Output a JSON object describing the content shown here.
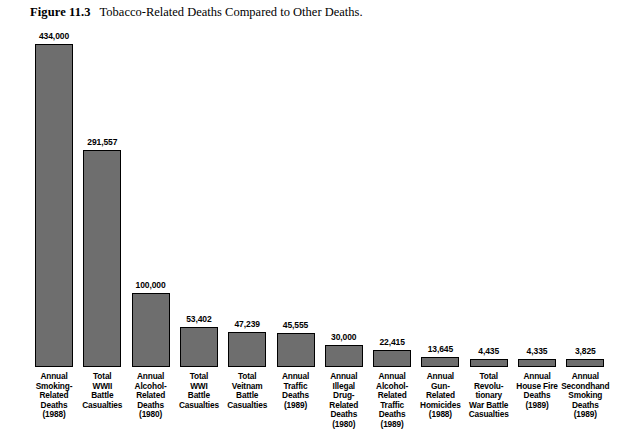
{
  "figure": {
    "label": "Figure 11.3",
    "title": "Tobacco-Related Deaths Compared to Other Deaths."
  },
  "chart_data": {
    "type": "bar",
    "title": "Tobacco-Related Deaths Compared to Other Deaths.",
    "xlabel": "",
    "ylabel": "",
    "ylim": [
      0,
      434000
    ],
    "grid": false,
    "legend": "none",
    "bar_color": "#6e6e6e",
    "bar_border_color": "#000000",
    "categories": [
      "Annual Smoking-Related Deaths (1988)",
      "Total WWII Battle Casualties",
      "Annual Alcohol-Related Deaths (1980)",
      "Total WWI Battle Casualties",
      "Total Veitnam Battle Casualties",
      "Annual Traffic Deaths (1989)",
      "Annual Illegal Drug-Related Deaths (1980)",
      "Annual Alcohol-Related Traffic Deaths (1989)",
      "Annual Gun-Related Homicides (1988)",
      "Total Revolutionary War Battle Casualties",
      "Annual House Fire Deaths (1989)",
      "Annual Secondhand Smoking Deaths (1989)"
    ],
    "values": [
      434000,
      291557,
      100000,
      53402,
      47239,
      45555,
      30000,
      22415,
      13645,
      4435,
      4335,
      3825
    ],
    "value_labels": [
      "434,000",
      "291,557",
      "100,000",
      "53,402",
      "47,239",
      "45,555",
      "30,000",
      "22,415",
      "13,645",
      "4,435",
      "4,335",
      "3,825"
    ],
    "category_label_lines": [
      [
        "Annual",
        "Smoking-",
        "Related",
        "Deaths",
        "(1988)"
      ],
      [
        "Total",
        "WWII",
        "Battle",
        "Casualties"
      ],
      [
        "Annual",
        "Alcohol-",
        "Related",
        "Deaths",
        "(1980)"
      ],
      [
        "Total",
        "WWI",
        "Battle",
        "Casualties"
      ],
      [
        "Total",
        "Veitnam",
        "Battle",
        "Casualties"
      ],
      [
        "Annual",
        "Traffic",
        "Deaths",
        "(1989)"
      ],
      [
        "Annual",
        "Illegal",
        "Drug-",
        "Related",
        "Deaths",
        "(1980)"
      ],
      [
        "Annual",
        "Alcohol-",
        "Related",
        "Traffic",
        "Deaths",
        "(1989)"
      ],
      [
        "Annual",
        "Gun-",
        "Related",
        "Homicides",
        "(1988)"
      ],
      [
        "Total",
        "Revolu-",
        "tionary",
        "War Battle",
        "Casualties"
      ],
      [
        "Annual",
        "House Fire",
        "Deaths",
        "(1989)"
      ],
      [
        "Annual",
        "Secondhand",
        "Smoking",
        "Deaths",
        "(1989)"
      ]
    ]
  }
}
